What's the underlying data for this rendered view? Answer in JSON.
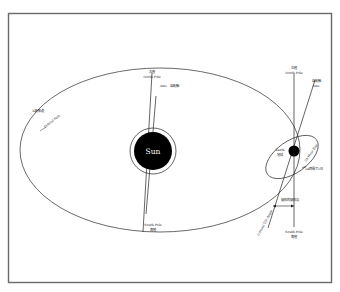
{
  "diagram": {
    "colors": {
      "frame": "#6a6a6a",
      "line": "#333333",
      "sun_fill": "#000000",
      "earth_fill": "#000000",
      "background": "#ffffff"
    },
    "orbit": {
      "label_jp": "公転軌道",
      "label_en": "Orbital Path"
    },
    "sun": {
      "label": "Sun",
      "north": {
        "label_jp": "北極",
        "label_en": "North Pole"
      },
      "axis": {
        "label_en": "Axis",
        "label_jp": "自転軸"
      },
      "south": {
        "label_en": "South Pole",
        "label_jp": "南極"
      }
    },
    "earth": {
      "label_en": "Earth",
      "label_jp": "地球",
      "north": {
        "label_jp": "北極",
        "label_en": "North Pole"
      },
      "axis": {
        "label_jp": "自転軸",
        "label_en": "Axis"
      },
      "day": {
        "label_en": "24-Hour Day",
        "label_jp": "24時間で1日"
      },
      "tilt": {
        "label_jp": "傾斜的傾斜角",
        "label_en": "Critical Tilt Angle"
      },
      "south": {
        "label_en": "South Pole",
        "label_jp": "南極"
      }
    }
  }
}
